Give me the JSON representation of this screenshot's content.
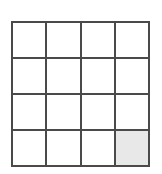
{
  "figure": {
    "type": "grid-diagram",
    "rows": 4,
    "columns": 4,
    "colors": {
      "background": "#ffffff",
      "line": "#4a4a4a",
      "cell_empty": "#ffffff",
      "cell_filled": "#e8e8e8"
    },
    "line_width_px": 2,
    "filled_cells": [
      {
        "row": 4,
        "column": 4
      }
    ],
    "cells": [
      [
        {
          "row": 1,
          "column": 1,
          "state": "empty",
          "label": ""
        },
        {
          "row": 1,
          "column": 2,
          "state": "empty",
          "label": ""
        },
        {
          "row": 1,
          "column": 3,
          "state": "empty",
          "label": ""
        },
        {
          "row": 1,
          "column": 4,
          "state": "empty",
          "label": ""
        }
      ],
      [
        {
          "row": 2,
          "column": 1,
          "state": "empty",
          "label": ""
        },
        {
          "row": 2,
          "column": 2,
          "state": "empty",
          "label": ""
        },
        {
          "row": 2,
          "column": 3,
          "state": "empty",
          "label": ""
        },
        {
          "row": 2,
          "column": 4,
          "state": "empty",
          "label": ""
        }
      ],
      [
        {
          "row": 3,
          "column": 1,
          "state": "empty",
          "label": ""
        },
        {
          "row": 3,
          "column": 2,
          "state": "empty",
          "label": ""
        },
        {
          "row": 3,
          "column": 3,
          "state": "empty",
          "label": ""
        },
        {
          "row": 3,
          "column": 4,
          "state": "empty",
          "label": ""
        }
      ],
      [
        {
          "row": 4,
          "column": 1,
          "state": "empty",
          "label": ""
        },
        {
          "row": 4,
          "column": 2,
          "state": "empty",
          "label": ""
        },
        {
          "row": 4,
          "column": 3,
          "state": "empty",
          "label": ""
        },
        {
          "row": 4,
          "column": 4,
          "state": "filled",
          "label": ""
        }
      ]
    ]
  }
}
